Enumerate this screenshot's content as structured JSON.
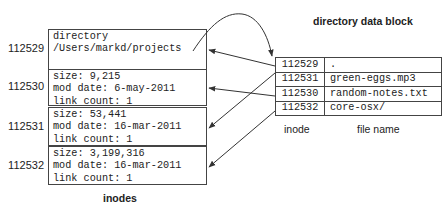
{
  "diagram": {
    "title_block": "directory data block",
    "inodes_label": "inodes",
    "inodes": [
      {
        "number": "112529",
        "lines": [
          "directory",
          "/Users/markd/projects",
          ""
        ]
      },
      {
        "number": "112530",
        "lines": [
          "size: 9,215",
          "mod date: 6-may-2011",
          "link count: 1"
        ]
      },
      {
        "number": "112531",
        "lines": [
          "size: 53,441",
          "mod date: 16-mar-2011",
          "link count: 1"
        ]
      },
      {
        "number": "112532",
        "lines": [
          "size: 3,199,316",
          "mod date: 16-mar-2011",
          "link count: 1"
        ]
      }
    ],
    "directory_table": {
      "columns": [
        "inode",
        "file name"
      ],
      "rows": [
        {
          "inode": "112529",
          "name": "."
        },
        {
          "inode": "112531",
          "name": "green-eggs.mp3"
        },
        {
          "inode": "112530",
          "name": "random-notes.txt"
        },
        {
          "inode": "112532",
          "name": "core-osx/"
        }
      ]
    },
    "links": [
      {
        "from_row": 0,
        "to_inode": "112529"
      },
      {
        "from_row": 1,
        "to_inode": "112531"
      },
      {
        "from_row": 2,
        "to_inode": "112530"
      },
      {
        "from_row": 3,
        "to_inode": "112532"
      },
      {
        "from_inode": "112529",
        "to": "directory data block",
        "style": "curved"
      }
    ],
    "colors": {
      "line": "#333333",
      "text": "#222222",
      "background": "#ffffff"
    }
  }
}
